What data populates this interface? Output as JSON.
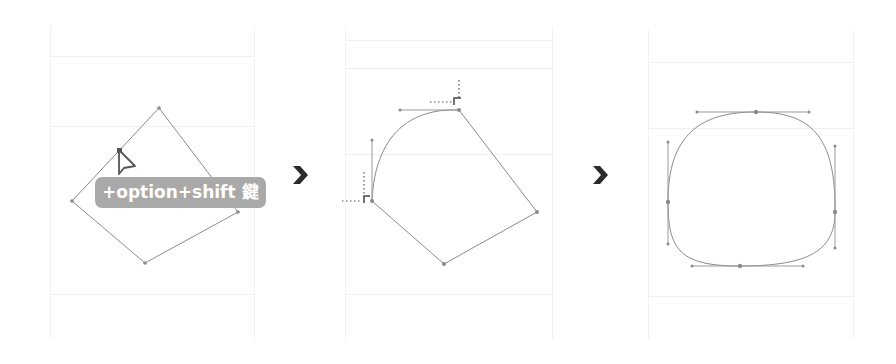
{
  "diagram": {
    "steps": [
      {
        "id": "step-1",
        "description": "Square rotated as diamond; cursor on anchor point with modifier keys"
      },
      {
        "id": "step-2",
        "description": "One corner converted to a smooth curve with handles; smart guides shown"
      },
      {
        "id": "step-3",
        "description": "All corners converted into smooth rounded shape with handles"
      }
    ],
    "tooltip": {
      "label": "+option+shift 鍵"
    },
    "arrows": [
      {
        "glyph": "chevron-right",
        "color": "#2b2b2b"
      },
      {
        "glyph": "chevron-right",
        "color": "#2b2b2b"
      }
    ],
    "colors": {
      "stroke": "#8a8a8a",
      "tooltip_bg": "#a9a9a9",
      "tooltip_text": "#ffffff",
      "grid": "#f0f0f0",
      "arrow": "#2b2b2b"
    }
  }
}
